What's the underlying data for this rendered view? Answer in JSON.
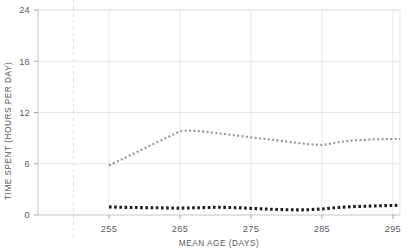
{
  "chart_data": {
    "type": "line",
    "title": "",
    "xlabel": "MEAN AGE (DAYS)",
    "ylabel": "TIME SPENT (HOURS PER DAY)",
    "xlim": [
      245,
      296
    ],
    "ylim": [
      0,
      24
    ],
    "xticks": [
      255,
      265,
      275,
      285,
      295
    ],
    "yticks": [
      0,
      6,
      12,
      18,
      24
    ],
    "xtick_labels": [
      "255",
      "265",
      "275",
      "285",
      "295"
    ],
    "ytick_labels": [
      "0",
      "6",
      "12",
      "18",
      "24"
    ],
    "grid": true,
    "legend": "none",
    "annotations": [
      {
        "name": "reference-line",
        "type": "vertical-dashed-line",
        "x": 250,
        "color": "#e3e3e3"
      }
    ],
    "series": [
      {
        "name": "upper-series",
        "style": "dotted",
        "color": "#8f9294",
        "x": [
          255,
          256,
          257,
          258,
          259,
          260,
          261,
          262,
          263,
          264,
          265,
          266,
          267,
          268,
          269,
          270,
          271,
          272,
          273,
          274,
          275,
          276,
          277,
          278,
          279,
          280,
          281,
          282,
          283,
          284,
          285,
          286,
          287,
          288,
          289,
          290,
          291,
          292,
          293,
          294,
          295,
          296
        ],
        "values": [
          5.8,
          6.2,
          6.6,
          7.0,
          7.4,
          7.8,
          8.2,
          8.6,
          9.0,
          9.4,
          9.8,
          9.9,
          9.85,
          9.8,
          9.7,
          9.6,
          9.5,
          9.4,
          9.3,
          9.2,
          9.1,
          9.0,
          8.9,
          8.8,
          8.7,
          8.6,
          8.5,
          8.4,
          8.3,
          8.25,
          8.2,
          8.3,
          8.5,
          8.6,
          8.7,
          8.75,
          8.8,
          8.85,
          8.85,
          8.9,
          8.9,
          8.9
        ]
      },
      {
        "name": "lower-series",
        "style": "dotted",
        "color": "#1d1d1d",
        "x": [
          255,
          256,
          257,
          258,
          259,
          260,
          261,
          262,
          263,
          264,
          265,
          266,
          267,
          268,
          269,
          270,
          271,
          272,
          273,
          274,
          275,
          276,
          277,
          278,
          279,
          280,
          281,
          282,
          283,
          284,
          285,
          286,
          287,
          288,
          289,
          290,
          291,
          292,
          293,
          294,
          295,
          296
        ],
        "values": [
          0.95,
          0.92,
          0.9,
          0.88,
          0.87,
          0.86,
          0.85,
          0.84,
          0.83,
          0.82,
          0.8,
          0.82,
          0.84,
          0.86,
          0.88,
          0.9,
          0.9,
          0.88,
          0.85,
          0.82,
          0.78,
          0.74,
          0.7,
          0.67,
          0.64,
          0.62,
          0.6,
          0.6,
          0.62,
          0.66,
          0.7,
          0.78,
          0.86,
          0.92,
          0.96,
          1.0,
          1.02,
          1.05,
          1.08,
          1.1,
          1.12,
          1.14
        ]
      }
    ]
  },
  "axis_label_x": "MEAN AGE (DAYS)",
  "axis_label_y": "TIME SPENT (HOURS PER DAY)"
}
